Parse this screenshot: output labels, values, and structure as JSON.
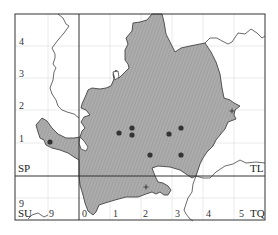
{
  "map": {
    "grid_squares": {
      "top_left": "SP",
      "top_right": "TL",
      "bottom_left": "SU",
      "bottom_right": "TQ"
    },
    "northing_labels": [
      {
        "label": "4",
        "y": 42
      },
      {
        "label": "3",
        "y": 74
      },
      {
        "label": "2",
        "y": 106
      },
      {
        "label": "1",
        "y": 139
      },
      {
        "label": "9",
        "y": 204
      }
    ],
    "easting_labels": [
      {
        "label": "9",
        "x": 49
      },
      {
        "label": "0",
        "x": 84
      },
      {
        "label": "1",
        "x": 114
      },
      {
        "label": "2",
        "x": 145
      },
      {
        "label": "3",
        "x": 177
      },
      {
        "label": "4",
        "x": 208
      },
      {
        "label": "5",
        "x": 240
      }
    ],
    "records": [
      {
        "x": 50,
        "y": 142
      },
      {
        "x": 119,
        "y": 133
      },
      {
        "x": 132,
        "y": 128
      },
      {
        "x": 132,
        "y": 135
      },
      {
        "x": 169,
        "y": 134
      },
      {
        "x": 181,
        "y": 128
      },
      {
        "x": 150,
        "y": 155
      },
      {
        "x": 181,
        "y": 155
      }
    ],
    "crosses": [
      {
        "x": 146,
        "y": 187
      },
      {
        "x": 232,
        "y": 111
      }
    ],
    "colors": {
      "region_fill": "#a8a8a8",
      "region_hatch": "#8f8f8f",
      "outline": "#444444",
      "grid_major": "#333333",
      "grid_minor": "#e2e2e2",
      "dot": "#333333"
    }
  }
}
